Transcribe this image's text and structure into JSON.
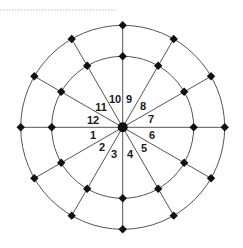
{
  "diagram": {
    "type": "radial-ring-network",
    "center": {
      "x": 122.7,
      "y": 127.3
    },
    "rings": [
      {
        "name": "inner",
        "radius": 71
      },
      {
        "name": "outer",
        "radius": 102
      }
    ],
    "spoke_count": 12,
    "spoke_angles_deg": [
      0,
      30,
      60,
      90,
      120,
      150,
      180,
      210,
      240,
      270,
      300,
      330
    ],
    "colors": {
      "line": "#555555",
      "node": "#111111",
      "label": "#1a1a1a",
      "dotted_rule": "#bbbbbb"
    },
    "labels": [
      {
        "text": "1",
        "x": 93,
        "y": 139
      },
      {
        "text": "2",
        "x": 102,
        "y": 151
      },
      {
        "text": "3",
        "x": 114,
        "y": 158
      },
      {
        "text": "4",
        "x": 130,
        "y": 158
      },
      {
        "text": "5",
        "x": 144,
        "y": 152
      },
      {
        "text": "6",
        "x": 152,
        "y": 139
      },
      {
        "text": "7",
        "x": 151,
        "y": 123
      },
      {
        "text": "8",
        "x": 143,
        "y": 110
      },
      {
        "text": "9",
        "x": 129,
        "y": 103
      },
      {
        "text": "10",
        "x": 115,
        "y": 103
      },
      {
        "text": "11",
        "x": 101,
        "y": 111
      },
      {
        "text": "12",
        "x": 93,
        "y": 124
      }
    ],
    "dotted_rule": {
      "x1": 0,
      "x2": 115,
      "y": 10
    }
  }
}
